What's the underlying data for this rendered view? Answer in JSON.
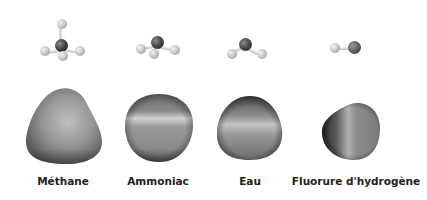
{
  "figure": {
    "molecules": [
      {
        "name": "Méthane",
        "formula_atoms": [
          "C",
          "H",
          "H",
          "H",
          "H"
        ],
        "center_x": 62
      },
      {
        "name": "Ammoniac",
        "formula_atoms": [
          "N",
          "H",
          "H",
          "H"
        ],
        "center_x": 157
      },
      {
        "name": "Eau",
        "formula_atoms": [
          "O",
          "H",
          "H"
        ],
        "center_x": 250
      },
      {
        "name": "Fluorure d'hydrogène",
        "formula_atoms": [
          "F",
          "H"
        ],
        "center_x": 355
      }
    ],
    "colors": {
      "background": "#ffffff",
      "label": "#222222",
      "surface_mid": "#8c8c8c",
      "surface_dark": "#3a3a3a",
      "surface_light": "#cfcfcf"
    }
  }
}
